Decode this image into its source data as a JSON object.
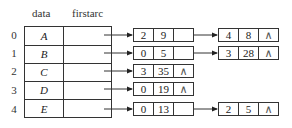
{
  "headers": {
    "data": "data",
    "firstarc": "firstarc"
  },
  "vertices": [
    {
      "index": "0",
      "data": "A",
      "arcs": [
        {
          "adjvex": "2",
          "info": "9"
        },
        {
          "adjvex": "4",
          "info": "8"
        }
      ]
    },
    {
      "index": "1",
      "data": "B",
      "arcs": [
        {
          "adjvex": "0",
          "info": "5"
        },
        {
          "adjvex": "3",
          "info": "28"
        }
      ]
    },
    {
      "index": "2",
      "data": "C",
      "arcs": [
        {
          "adjvex": "3",
          "info": "35"
        }
      ]
    },
    {
      "index": "3",
      "data": "D",
      "arcs": [
        {
          "adjvex": "0",
          "info": "19"
        }
      ]
    },
    {
      "index": "4",
      "data": "E",
      "arcs": [
        {
          "adjvex": "0",
          "info": "13"
        },
        {
          "adjvex": "2",
          "info": "5"
        }
      ]
    }
  ],
  "null_symbol": "∧"
}
